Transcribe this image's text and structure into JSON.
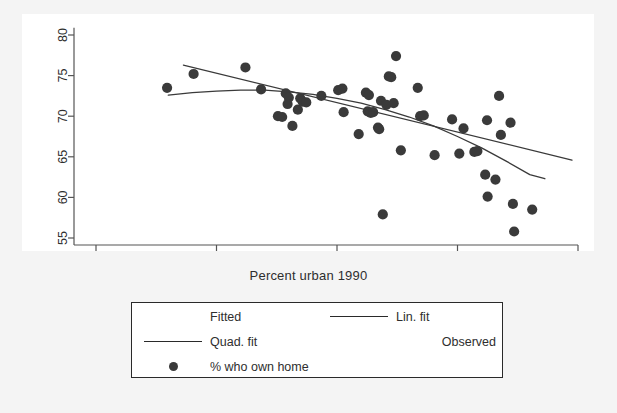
{
  "chart_data": {
    "type": "scatter",
    "title": "",
    "xlabel": "Percent urban 1990",
    "ylabel": "",
    "xlim": [
      17.5,
      101.5
    ],
    "ylim": [
      54.2,
      80.8
    ],
    "xticks": [
      20,
      40,
      60,
      80,
      100
    ],
    "yticks": [
      55,
      60,
      65,
      70,
      75,
      80
    ],
    "grid": false,
    "marker_color": "#3a3a3a",
    "line_color": "#3a3a3a",
    "panel_color": "#ffffff",
    "background_color": "#f4f4f4",
    "series": [
      {
        "name": "% who own home",
        "type": "scatter",
        "points": [
          [
            31.8,
            73.5
          ],
          [
            36.2,
            75.2
          ],
          [
            44.8,
            76.0
          ],
          [
            47.4,
            73.3
          ],
          [
            50.2,
            70.0
          ],
          [
            50.9,
            69.9
          ],
          [
            51.5,
            72.8
          ],
          [
            52.0,
            72.3
          ],
          [
            51.8,
            71.5
          ],
          [
            52.6,
            68.8
          ],
          [
            53.5,
            70.8
          ],
          [
            53.9,
            72.2
          ],
          [
            54.3,
            71.8
          ],
          [
            54.9,
            71.7
          ],
          [
            57.4,
            72.5
          ],
          [
            60.2,
            73.2
          ],
          [
            60.9,
            73.4
          ],
          [
            61.1,
            70.5
          ],
          [
            63.6,
            67.8
          ],
          [
            64.8,
            72.9
          ],
          [
            65.3,
            72.6
          ],
          [
            65.1,
            70.6
          ],
          [
            65.6,
            70.4
          ],
          [
            66.0,
            70.5
          ],
          [
            66.8,
            68.6
          ],
          [
            67.0,
            68.4
          ],
          [
            67.3,
            71.9
          ],
          [
            67.6,
            57.9
          ],
          [
            68.2,
            71.4
          ],
          [
            68.6,
            74.9
          ],
          [
            69.0,
            74.8
          ],
          [
            69.4,
            71.6
          ],
          [
            69.8,
            77.4
          ],
          [
            70.6,
            65.8
          ],
          [
            73.4,
            73.5
          ],
          [
            73.8,
            70.0
          ],
          [
            74.4,
            70.1
          ],
          [
            76.2,
            65.2
          ],
          [
            79.1,
            69.6
          ],
          [
            80.3,
            65.4
          ],
          [
            81.0,
            68.5
          ],
          [
            82.8,
            65.6
          ],
          [
            83.3,
            65.7
          ],
          [
            84.6,
            62.8
          ],
          [
            84.9,
            69.5
          ],
          [
            85.0,
            60.1
          ],
          [
            86.3,
            62.2
          ],
          [
            86.9,
            72.5
          ],
          [
            87.2,
            67.7
          ],
          [
            88.8,
            69.2
          ],
          [
            89.2,
            59.2
          ],
          [
            89.4,
            55.8
          ],
          [
            92.4,
            58.5
          ]
        ]
      },
      {
        "name": "Lin. fit",
        "type": "line",
        "points": [
          [
            34.5,
            76.3
          ],
          [
            99.0,
            64.6
          ]
        ]
      },
      {
        "name": "Quad. fit",
        "type": "line",
        "points": [
          [
            32.0,
            72.6
          ],
          [
            36.0,
            72.9
          ],
          [
            40.0,
            73.1
          ],
          [
            44.0,
            73.2
          ],
          [
            48.0,
            73.2
          ],
          [
            52.0,
            73.0
          ],
          [
            56.0,
            72.7
          ],
          [
            60.0,
            72.2
          ],
          [
            64.0,
            71.6
          ],
          [
            68.0,
            70.8
          ],
          [
            72.0,
            69.9
          ],
          [
            76.0,
            68.8
          ],
          [
            80.0,
            67.5
          ],
          [
            84.0,
            66.1
          ],
          [
            88.0,
            64.5
          ],
          [
            92.0,
            62.8
          ],
          [
            94.5,
            62.3
          ]
        ]
      }
    ]
  },
  "axes": {
    "x_title": "Percent urban 1990"
  },
  "legend": {
    "rows": [
      {
        "left": {
          "swatch": "none",
          "label": "Fitted",
          "align": "left"
        },
        "right": {
          "swatch": "line-thick",
          "label": "Lin. fit",
          "align": "left"
        }
      },
      {
        "left": {
          "swatch": "line-thin",
          "label": "Quad. fit",
          "align": "left"
        },
        "right": {
          "swatch": "none",
          "label": "Observed",
          "align": "right"
        }
      },
      {
        "left": {
          "swatch": "dot",
          "label": "% who own home",
          "align": "left"
        },
        "right": {
          "swatch": "none",
          "label": "",
          "align": "left"
        }
      }
    ]
  }
}
